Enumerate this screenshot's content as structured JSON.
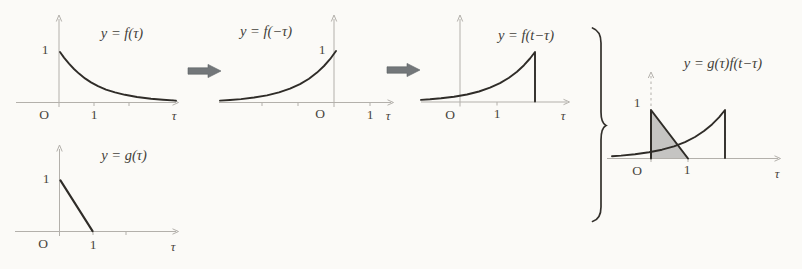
{
  "colors": {
    "background": "#fbfaf7",
    "curve": "#2f2c28",
    "axis": "#b3b0ab",
    "label": "#4a4540",
    "arrow": "#73777a",
    "shade": "#c5c4c2",
    "brace": "#33302c"
  },
  "panels": {
    "f_tau": {
      "title": "y = f(τ)",
      "y_one": "1",
      "origin": "O",
      "x_one": "1",
      "x_axis": "τ"
    },
    "f_neg_tau": {
      "title": "y = f(−τ)",
      "y_one": "1",
      "origin": "O",
      "x_one": "1",
      "x_axis": "τ"
    },
    "f_t_minus_tau": {
      "title": "y = f(t−τ)",
      "origin": "O",
      "x_one": "1",
      "x_axis": "τ"
    },
    "g_tau": {
      "title": "y = g(τ)",
      "y_one": "1",
      "origin": "O",
      "x_one": "1",
      "x_axis": "τ"
    },
    "product": {
      "title": "y = g(τ)f(t−τ)",
      "y_one": "1",
      "origin": "O",
      "x_one": "1",
      "x_axis": "τ"
    }
  }
}
